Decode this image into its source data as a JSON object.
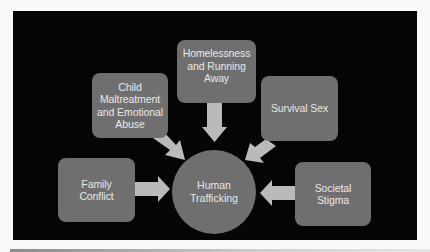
{
  "diagram": {
    "type": "hub-and-spoke",
    "center": {
      "label": "Human Trafficking",
      "lines": [
        "Human",
        "Trafficking"
      ]
    },
    "causes": [
      {
        "id": "family-conflict",
        "label": "Family Conflict",
        "lines": [
          "Family",
          "Conflict"
        ],
        "arrow_direction": "right"
      },
      {
        "id": "child-maltreatment",
        "label": "Child Maltreatment and Emotional Abuse",
        "lines": [
          "Child",
          "Maltreatment",
          "and Emotional",
          "Abuse"
        ],
        "arrow_direction": "down-right"
      },
      {
        "id": "homelessness",
        "label": "Homelessness and Running Away",
        "lines": [
          "Homelessness",
          "and Running",
          "Away"
        ],
        "arrow_direction": "down"
      },
      {
        "id": "survival-sex",
        "label": "Survival Sex",
        "lines": [
          "Survival Sex"
        ],
        "arrow_direction": "down-left"
      },
      {
        "id": "societal-stigma",
        "label": "Societal Stigma",
        "lines": [
          "Societal",
          "Stigma"
        ],
        "arrow_direction": "left"
      }
    ],
    "colors": {
      "background": "#050505",
      "node_fill": "#6f6f6f",
      "node_text": "#e8e8e8",
      "arrow_fill": "#bababa",
      "page": "#fafafa"
    }
  }
}
